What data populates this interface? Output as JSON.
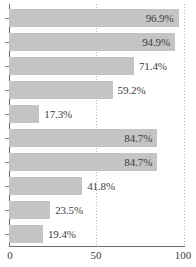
{
  "chart_data": {
    "type": "bar",
    "orientation": "horizontal",
    "title": "",
    "xlabel": "",
    "ylabel": "",
    "xlim": [
      0,
      100
    ],
    "xticks": [
      "0",
      "50",
      "100"
    ],
    "xtick_values": [
      0,
      50,
      100
    ],
    "gridlines": [
      50,
      100
    ],
    "grid": true,
    "legend": false,
    "bar_color": "#c4c4c4",
    "axis_color": "#6b6b6b",
    "label_color": "#3d3d3d",
    "categories": [
      "",
      "",
      "",
      "",
      "",
      "",
      "",
      "",
      "",
      ""
    ],
    "values": [
      96.9,
      94.9,
      71.4,
      59.2,
      17.3,
      84.7,
      84.7,
      41.8,
      23.5,
      19.4
    ],
    "value_labels": [
      "96.9%",
      "94.9%",
      "71.4%",
      "59.2%",
      "17.3%",
      "84.7%",
      "84.7%",
      "41.8%",
      "23.5%",
      "19.4%"
    ],
    "label_placement": [
      "inside",
      "inside",
      "outside",
      "outside",
      "outside",
      "inside",
      "inside",
      "outside",
      "outside",
      "outside"
    ]
  }
}
